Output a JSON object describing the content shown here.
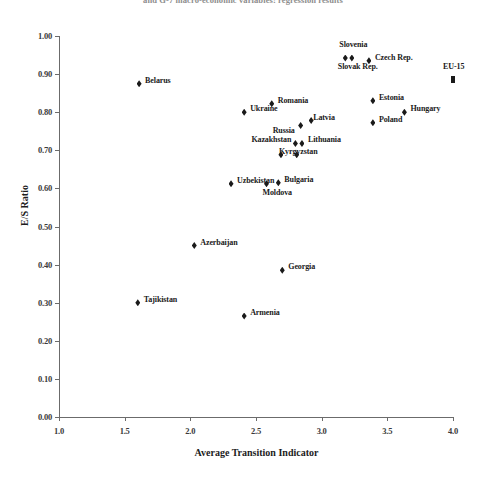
{
  "caption": "and G-7 macro-economic variables: regression results",
  "chart_data": {
    "type": "scatter",
    "title": "",
    "xlabel": "Average Transition Indicator",
    "ylabel": "E/S Ratio",
    "xlim": [
      1.0,
      4.0
    ],
    "ylim": [
      0.0,
      1.0
    ],
    "xticks": [
      "1.0",
      "1.5",
      "2.0",
      "2.5",
      "3.0",
      "3.5",
      "4.0"
    ],
    "yticks": [
      "0.00",
      "0.10",
      "0.20",
      "0.30",
      "0.40",
      "0.50",
      "0.60",
      "0.70",
      "0.80",
      "0.90",
      "1.00"
    ],
    "grid": false,
    "legend": null,
    "marker_color": "#1a1a1a",
    "points": [
      {
        "name": "Belarus",
        "x": 1.61,
        "y": 0.875,
        "label_dx": 6,
        "label_dy": -4,
        "marker": "diamond"
      },
      {
        "name": "Tajikistan",
        "x": 1.6,
        "y": 0.3,
        "label_dx": 6,
        "label_dy": -4,
        "marker": "diamond"
      },
      {
        "name": "Azerbaijan",
        "x": 2.03,
        "y": 0.45,
        "label_dx": 6,
        "label_dy": -4,
        "marker": "diamond"
      },
      {
        "name": "Armenia",
        "x": 2.41,
        "y": 0.265,
        "label_dx": 6,
        "label_dy": -4,
        "marker": "diamond"
      },
      {
        "name": "Uzbekistan",
        "x": 2.31,
        "y": 0.612,
        "label_dx": 6,
        "label_dy": -4,
        "marker": "diamond"
      },
      {
        "name": "Moldova",
        "x": 2.58,
        "y": 0.612,
        "label_dx": -4,
        "label_dy": 8,
        "marker": "diamond"
      },
      {
        "name": "Bulgaria",
        "x": 2.67,
        "y": 0.615,
        "label_dx": 6,
        "label_dy": -4,
        "marker": "diamond"
      },
      {
        "name": "Georgia",
        "x": 2.7,
        "y": 0.385,
        "label_dx": 6,
        "label_dy": -4,
        "marker": "diamond"
      },
      {
        "name": "Ukraine",
        "x": 2.41,
        "y": 0.8,
        "label_dx": 6,
        "label_dy": -4,
        "marker": "diamond"
      },
      {
        "name": "Romania",
        "x": 2.62,
        "y": 0.822,
        "label_dx": 6,
        "label_dy": -4,
        "marker": "diamond"
      },
      {
        "name": "Kyrgyzstan",
        "x": 2.69,
        "y": 0.688,
        "label_dx": -2,
        "label_dy": -4,
        "marker": "diamond"
      },
      {
        "name": "Kyrgyzstan2",
        "x": 2.81,
        "y": 0.688,
        "label_dx": 6,
        "label_dy": -4,
        "marker": "diamond"
      },
      {
        "name": "Kazakhstan",
        "x": 2.8,
        "y": 0.718,
        "label_dx": -44,
        "label_dy": -4,
        "marker": "diamond"
      },
      {
        "name": "Lithuania",
        "x": 2.85,
        "y": 0.718,
        "label_dx": 6,
        "label_dy": -4,
        "marker": "diamond"
      },
      {
        "name": "Russia",
        "x": 2.84,
        "y": 0.765,
        "label_dx": -28,
        "label_dy": 4,
        "marker": "diamond"
      },
      {
        "name": "Latvia",
        "x": 2.92,
        "y": 0.778,
        "label_dx": 2,
        "label_dy": -4,
        "marker": "diamond"
      },
      {
        "name": "Slovenia",
        "x": 3.18,
        "y": 0.942,
        "label_dx": -6,
        "label_dy": -14,
        "marker": "diamond"
      },
      {
        "name": "Slovak Rep.",
        "x": 3.23,
        "y": 0.942,
        "label_dx": -14,
        "label_dy": 8,
        "marker": "diamond"
      },
      {
        "name": "Czech Rep.",
        "x": 3.36,
        "y": 0.935,
        "label_dx": 6,
        "label_dy": -4,
        "marker": "diamond"
      },
      {
        "name": "Estonia",
        "x": 3.39,
        "y": 0.83,
        "label_dx": 6,
        "label_dy": -4,
        "marker": "diamond"
      },
      {
        "name": "Poland",
        "x": 3.39,
        "y": 0.772,
        "label_dx": 6,
        "label_dy": -4,
        "marker": "diamond"
      },
      {
        "name": "Hungary",
        "x": 3.63,
        "y": 0.8,
        "label_dx": 6,
        "label_dy": -4,
        "marker": "diamond"
      },
      {
        "name": "EU-15",
        "x": 4.0,
        "y": 0.885,
        "label_dx": -10,
        "label_dy": -14,
        "marker": "square"
      }
    ]
  }
}
